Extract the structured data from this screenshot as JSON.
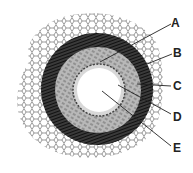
{
  "diagram": {
    "labels": [
      {
        "id": "A",
        "text": "A",
        "x": 171,
        "y": 17
      },
      {
        "id": "B",
        "text": "B",
        "x": 173,
        "y": 47
      },
      {
        "id": "C",
        "text": "C",
        "x": 173,
        "y": 80
      },
      {
        "id": "D",
        "text": "D",
        "x": 173,
        "y": 111
      },
      {
        "id": "E",
        "text": "E",
        "x": 173,
        "y": 142
      }
    ]
  }
}
